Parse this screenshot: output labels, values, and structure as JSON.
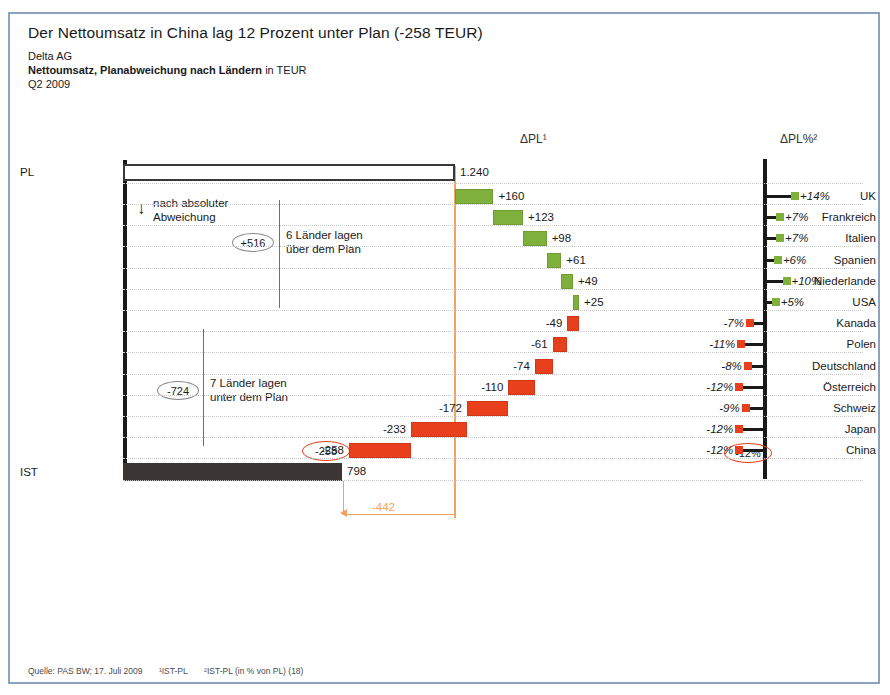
{
  "header": {
    "title": "Der Nettoumsatz in China lag 12 Prozent unter Plan (-258 TEUR)",
    "company": "Delta AG",
    "measure_bold": "Nettoumsatz, Planabweichung nach Ländern",
    "measure_unit": " in TEUR",
    "period": "Q2 2009"
  },
  "columns": {
    "delta_abs": "ΔPL¹",
    "delta_pct": "ΔPL%²"
  },
  "annotations": {
    "sort_note_line1": "nach absoluter",
    "sort_note_line2": "Abweichung",
    "arrow_glyph": "↓",
    "positive_sum": "+516",
    "positive_text_line1": "6 Länder lagen",
    "positive_text_line2": "über dem Plan",
    "negative_sum": "-724",
    "negative_text_line1": "7 Länder lagen",
    "negative_text_line2": "unter dem Plan",
    "highlight_value": "-258",
    "highlight_pct": "-12%",
    "measure_label": "-442"
  },
  "anchors": {
    "plan_label": "PL",
    "plan_value": "1.240",
    "actual_label": "IST",
    "actual_value": "798"
  },
  "footer": {
    "source": "Quelle: PAS BW; 17. Juli 2009",
    "note1": "¹IST-PL",
    "note2": "²IST-PL (in % von PL)  (18)"
  },
  "colors": {
    "positive": "#7fb03c",
    "negative": "#e8401c",
    "plan_line": "#f2a35e",
    "actual_bar": "#3b3634",
    "frame": "#8ba2c0"
  },
  "chart_data": {
    "type": "bar",
    "title": "Nettoumsatz, Planabweichung nach Ländern in TEUR",
    "subtitle": "Delta AG — Q2 2009",
    "xlabel": "",
    "ylabel": "",
    "grid": true,
    "legend": "none",
    "start_label": "PL",
    "start_value": 1240,
    "end_label": "IST",
    "end_value": 798,
    "total_deviation": -442,
    "positive_subtotal": 516,
    "negative_subtotal": -724,
    "categories": [
      "UK",
      "Frankreich",
      "Italien",
      "Spanien",
      "Niederlande",
      "USA",
      "Kanada",
      "Polen",
      "Deutschland",
      "Österreich",
      "Schweiz",
      "Japan",
      "China"
    ],
    "values": [
      160,
      123,
      98,
      61,
      49,
      25,
      -49,
      -61,
      -74,
      -110,
      -172,
      -233,
      -258
    ],
    "value_labels": [
      "+160",
      "+123",
      "+98",
      "+61",
      "+49",
      "+25",
      "-49",
      "-61",
      "-74",
      "-110",
      "-172",
      "-233",
      "-258"
    ],
    "percent_values": [
      14,
      7,
      7,
      6,
      10,
      5,
      -7,
      -11,
      -8,
      -12,
      -9,
      -12,
      -12
    ],
    "percent_labels": [
      "+14%",
      "+7%",
      "+7%",
      "+6%",
      "+10%",
      "+5%",
      "-7%",
      "-11%",
      "-8%",
      "-12%",
      "-9%",
      "-12%",
      "-12%"
    ]
  }
}
